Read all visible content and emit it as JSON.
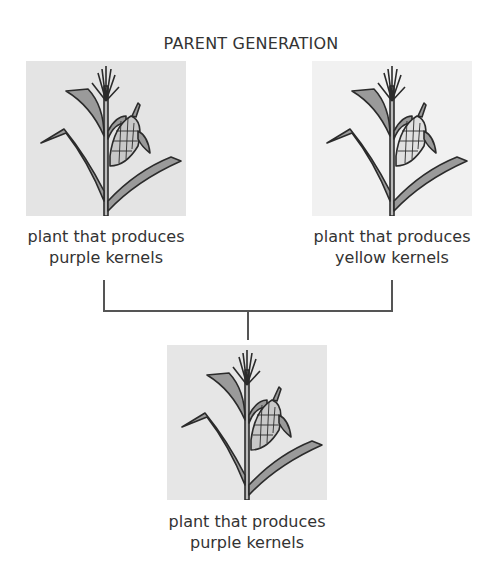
{
  "diagram": {
    "title": "PARENT GENERATION",
    "parents": [
      {
        "caption_line1": "plant that produces",
        "caption_line2": "purple kernels",
        "background": "#e4e4e4"
      },
      {
        "caption_line1": "plant that produces",
        "caption_line2": "yellow kernels",
        "background": "#f1f1f1"
      }
    ],
    "offspring": {
      "caption_line1": "plant that produces",
      "caption_line2": "purple kernels",
      "background": "#e6e6e6"
    },
    "colors": {
      "stroke": "#2b2b2b",
      "leaf_fill": "#9a9a9a",
      "connector": "#555555"
    }
  }
}
